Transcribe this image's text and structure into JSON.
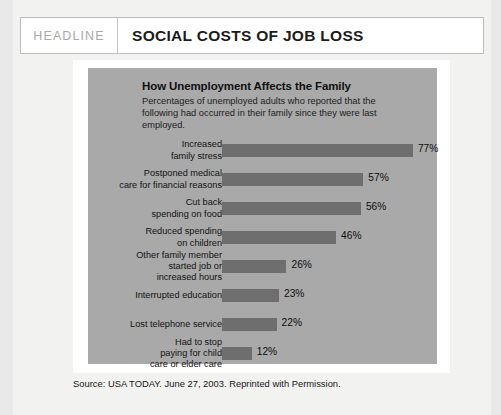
{
  "header": {
    "kicker": "HEADLINE",
    "title": "SOCIAL COSTS OF JOB LOSS"
  },
  "figure": {
    "title": "How Unemployment Affects the Family",
    "subtitle": "Percentages of unemployed adults who reported that the following had occurred in their family since they were last employed.",
    "source": "Source: USA TODAY. June 27, 2003. Reprinted with Permission."
  },
  "colors": {
    "page_background": "#e9e9e9",
    "sheet": "#f2f2f1",
    "panel_gray": "#a9a9a9",
    "bar_gray": "#6e6e6e",
    "frame_white": "#ffffff",
    "header_border": "#bdbdbd",
    "kicker_text": "#a8a8a8"
  },
  "chart_data": {
    "type": "bar",
    "orientation": "horizontal",
    "title": "How Unemployment Affects the Family",
    "subtitle": "Percentages of unemployed adults who reported that the following had occurred in their family since they were last employed.",
    "xlabel": "",
    "ylabel": "",
    "xlim": [
      0,
      80
    ],
    "grid": false,
    "legend": false,
    "unit": "%",
    "categories": [
      "Increased\nfamily stress",
      "Postponed medical\ncare for financial reasons",
      "Cut back\nspending on food",
      "Reduced spending\non children",
      "Other family member\nstarted job or\nincreased hours",
      "Interrupted education",
      "Lost telephone service",
      "Had to stop\npaying for child\ncare or elder care"
    ],
    "values": [
      77,
      57,
      56,
      46,
      26,
      23,
      22,
      12
    ],
    "value_labels": [
      "77%",
      "57%",
      "56%",
      "46%",
      "26%",
      "23%",
      "22%",
      "12%"
    ]
  }
}
